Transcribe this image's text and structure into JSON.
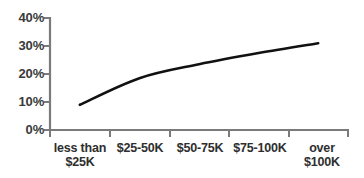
{
  "chart_data": {
    "type": "line",
    "title": "",
    "subtitle": "",
    "xlabel": "",
    "ylabel": "",
    "categories": [
      "less than $25K",
      "$25-50K",
      "$50-75K",
      "$75-100K",
      "over $100K"
    ],
    "category_lines": [
      [
        "less than",
        "$25K"
      ],
      [
        "$25-50K"
      ],
      [
        "$50-75K"
      ],
      [
        "$75-100K"
      ],
      [
        "over",
        "$100K"
      ]
    ],
    "values": [
      9,
      18.5,
      23.5,
      27.5,
      31
    ],
    "series": [
      {
        "name": "",
        "values": [
          9,
          18.5,
          23.5,
          27.5,
          31
        ]
      }
    ],
    "ylim": [
      0,
      40
    ],
    "yticks": [
      0,
      10,
      20,
      30,
      40
    ],
    "ytick_labels": [
      "0%",
      "10%",
      "20%",
      "30%",
      "40%"
    ],
    "grid": false,
    "legend": false,
    "legend_position": "none",
    "line_color": "#111111",
    "axis_color": "#7a7a7a",
    "background_color": "#ffffff"
  }
}
